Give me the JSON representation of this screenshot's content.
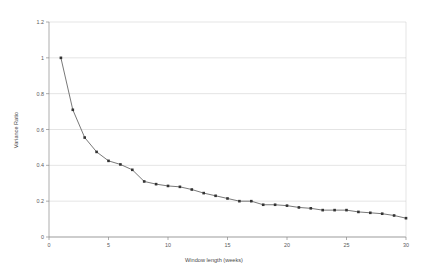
{
  "chart_data": {
    "type": "line",
    "title": "",
    "subtitle": "",
    "xlabel": "Window length (weeks)",
    "ylabel": "Variance Ratio",
    "xlim": [
      0,
      30
    ],
    "ylim": [
      0,
      1.2
    ],
    "xticks": [
      0,
      5,
      10,
      15,
      20,
      25,
      30
    ],
    "xtick_labels": [
      "0",
      "5",
      "10",
      "15",
      "20",
      "25",
      "30"
    ],
    "yticks": [
      0,
      0.2,
      0.4,
      0.6,
      0.8,
      1,
      1.2
    ],
    "ytick_labels": [
      "0",
      "0.2",
      "0.4",
      "0.6",
      "0.8",
      "1",
      "1.2"
    ],
    "grid": "horizontal",
    "legend": "none",
    "legend_entries": [],
    "annotations": [],
    "marker": "square",
    "line_color": "#555555",
    "marker_color": "#333333",
    "grid_color": "#c9c9c9",
    "axis_color": "#8a8a8a",
    "background_color": "#ffffff",
    "series": [
      {
        "name": "Variance Ratio",
        "x": [
          1,
          2,
          3,
          4,
          5,
          6,
          7,
          8,
          9,
          10,
          11,
          12,
          13,
          14,
          15,
          16,
          17,
          18,
          19,
          20,
          21,
          22,
          23,
          24,
          25,
          26,
          27,
          28,
          29,
          30
        ],
        "values": [
          1.0,
          0.71,
          0.555,
          0.475,
          0.425,
          0.405,
          0.375,
          0.31,
          0.295,
          0.285,
          0.28,
          0.265,
          0.245,
          0.23,
          0.215,
          0.2,
          0.2,
          0.18,
          0.18,
          0.175,
          0.165,
          0.16,
          0.15,
          0.15,
          0.15,
          0.14,
          0.135,
          0.13,
          0.12,
          0.105
        ]
      }
    ]
  },
  "axis_labels": {
    "x_title": "Window length (weeks)",
    "y_title": "Variance Ratio"
  }
}
